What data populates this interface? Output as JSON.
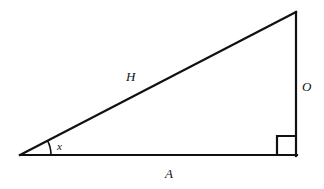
{
  "figure": {
    "name": "right-triangle-trigonometry-diagram",
    "background_color": "#ffffff",
    "stroke_color": "#111111"
  },
  "labels": {
    "hypotenuse": "H",
    "opposite": "O",
    "adjacent": "A",
    "angle": "x"
  },
  "geometry": {
    "vertices": {
      "left": {
        "x": 20,
        "y": 155
      },
      "apex": {
        "x": 296,
        "y": 12
      },
      "right": {
        "x": 296,
        "y": 155
      }
    },
    "angle_arc": {
      "cx": 20,
      "cy": 155,
      "radius": 31
    },
    "right_angle_marker": {
      "x": 277,
      "y": 136,
      "size": 19
    },
    "stroke_width": 2.2
  }
}
